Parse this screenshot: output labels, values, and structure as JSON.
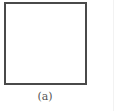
{
  "figure": {
    "shape": "square",
    "caption": "(a)",
    "colors": {
      "border": "#4a4a4a",
      "fill": "#ffffff",
      "caption": "#555555",
      "background": "#ffffff"
    }
  }
}
